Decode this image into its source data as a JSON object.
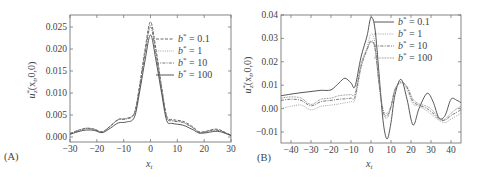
{
  "chart_data": [
    {
      "panel": "(A)",
      "type": "line",
      "xlabel": "x_t",
      "ylabel": "u*_z (x_t,0,0)",
      "xlim": [
        -30,
        30
      ],
      "ylim": [
        -0.001,
        0.028
      ],
      "xticks": [
        -30,
        -20,
        -10,
        0,
        10,
        20,
        30
      ],
      "xtick_labels": [
        "−30",
        "−20",
        "−10",
        "0",
        "10",
        "20",
        "30"
      ],
      "yticks": [
        0.0,
        0.005,
        0.01,
        0.015,
        0.02,
        0.025
      ],
      "ytick_labels": [
        "0.000",
        "0.005",
        "0.010",
        "0.015",
        "0.020",
        "0.025"
      ],
      "legend_position": "upper right",
      "grid": false,
      "x": [
        -30,
        -27,
        -24,
        -21,
        -18,
        -15,
        -12,
        -9,
        -6,
        -4,
        -2,
        0,
        2,
        4,
        6,
        8,
        10,
        12,
        14,
        16,
        18,
        20,
        22,
        24,
        26,
        28,
        30
      ],
      "series": [
        {
          "name": "b* = 0.1",
          "style": "dashed",
          "values": [
            0.0008,
            0.0015,
            0.002,
            0.0018,
            0.0012,
            0.0025,
            0.004,
            0.0042,
            0.0055,
            0.012,
            0.02,
            0.0262,
            0.02,
            0.012,
            0.0048,
            0.004,
            0.0038,
            0.0036,
            0.003,
            0.0022,
            0.0012,
            0.0012,
            0.0015,
            0.0018,
            0.0016,
            0.001,
            0.0004
          ]
        },
        {
          "name": "b* = 1",
          "style": "dotted",
          "values": [
            0.0008,
            0.0015,
            0.002,
            0.0018,
            0.0012,
            0.0025,
            0.004,
            0.0042,
            0.0055,
            0.0118,
            0.0195,
            0.0255,
            0.0195,
            0.0118,
            0.0046,
            0.0038,
            0.0036,
            0.0034,
            0.0028,
            0.002,
            0.0011,
            0.0011,
            0.0014,
            0.0016,
            0.0014,
            0.0009,
            0.0004
          ]
        },
        {
          "name": "b* = 10",
          "style": "dash-dot",
          "values": [
            0.0007,
            0.0014,
            0.0019,
            0.0017,
            0.0011,
            0.0024,
            0.0039,
            0.0041,
            0.0053,
            0.0115,
            0.019,
            0.025,
            0.019,
            0.0115,
            0.0045,
            0.0037,
            0.0035,
            0.0033,
            0.0027,
            0.002,
            0.0011,
            0.0011,
            0.0014,
            0.0016,
            0.0014,
            0.0009,
            0.0004
          ]
        },
        {
          "name": "b* = 100",
          "style": "solid",
          "values": [
            0.0006,
            0.0012,
            0.0016,
            0.0015,
            0.001,
            0.002,
            0.0032,
            0.0034,
            0.0045,
            0.0105,
            0.0175,
            0.0232,
            0.0175,
            0.0105,
            0.0038,
            0.0031,
            0.0029,
            0.0027,
            0.0022,
            0.0016,
            0.0009,
            0.0009,
            0.0011,
            0.0013,
            0.0012,
            0.0008,
            0.0003
          ]
        }
      ]
    },
    {
      "panel": "(B)",
      "type": "line",
      "xlabel": "x_t",
      "ylabel": "u*_z (x_t,0,0)",
      "xlim": [
        -45,
        45
      ],
      "ylim": [
        -0.015,
        0.04
      ],
      "xticks": [
        -40,
        -30,
        -20,
        -10,
        0,
        10,
        20,
        30,
        40
      ],
      "xtick_labels": [
        "−40",
        "−30",
        "−20",
        "−10",
        "0",
        "10",
        "20",
        "30",
        "40"
      ],
      "yticks": [
        -0.01,
        0.0,
        0.01,
        0.02,
        0.03,
        0.04
      ],
      "ytick_labels": [
        "−0.01",
        "0.00",
        "0.01",
        "0.02",
        "0.03",
        "0.04"
      ],
      "legend_position": "upper right",
      "grid": false,
      "x": [
        -45,
        -40,
        -35,
        -30,
        -25,
        -20,
        -16,
        -13,
        -10,
        -8,
        -5,
        -2,
        0,
        2,
        4,
        6,
        8,
        10,
        12,
        15,
        18,
        21,
        24,
        28,
        31,
        34,
        37,
        40,
        43,
        45
      ],
      "series": [
        {
          "name": "b* = 0.1",
          "style": "solid",
          "values": [
            0.0055,
            0.0062,
            0.0068,
            0.0073,
            0.0078,
            0.008,
            0.011,
            0.013,
            0.011,
            0.0095,
            0.022,
            0.031,
            0.039,
            0.034,
            0.015,
            -0.005,
            -0.013,
            -0.006,
            0.006,
            0.0125,
            0.004,
            -0.007,
            0.0,
            0.0065,
            0.003,
            -0.004,
            -0.003,
            0.004,
            0.0035,
            0.0025
          ]
        },
        {
          "name": "b* = 1",
          "style": "dotted",
          "values": [
            0.0,
            0.001,
            0.0015,
            -0.0005,
            0.001,
            0.0015,
            0.002,
            0.0025,
            0.003,
            0.004,
            0.017,
            0.026,
            0.032,
            0.028,
            0.012,
            0.0,
            -0.002,
            0.001,
            0.007,
            0.012,
            0.008,
            0.002,
            0.001,
            -0.001,
            -0.003,
            -0.005,
            -0.006,
            -0.0045,
            -0.003,
            -0.002
          ]
        },
        {
          "name": "b* = 10",
          "style": "dash-dot",
          "values": [
            0.0035,
            0.004,
            0.0035,
            0.0012,
            0.003,
            0.0035,
            0.004,
            0.0042,
            0.0045,
            0.005,
            0.018,
            0.025,
            0.029,
            0.026,
            0.011,
            -0.001,
            -0.003,
            0.001,
            0.008,
            0.0115,
            0.009,
            0.003,
            0.0015,
            0.0,
            -0.002,
            -0.0045,
            -0.005,
            -0.003,
            -0.0015,
            -0.0005
          ]
        },
        {
          "name": "b* = 100",
          "style": "dense-dotted",
          "values": [
            0.0045,
            0.005,
            0.0045,
            0.0018,
            0.004,
            0.0045,
            0.0055,
            0.0058,
            0.006,
            0.0065,
            0.019,
            0.0255,
            0.0285,
            0.0255,
            0.0105,
            -0.0015,
            -0.004,
            0.0005,
            0.0085,
            0.011,
            0.0095,
            0.004,
            0.002,
            0.001,
            -0.001,
            -0.004,
            -0.0045,
            -0.002,
            0.0,
            0.001
          ]
        }
      ]
    }
  ],
  "panels": {
    "a": {
      "label": "(A)",
      "xlabel": "x",
      "xlabel_sub": "t",
      "ylabel_main": "u",
      "ylabel_sup": "*",
      "ylabel_sub": "z",
      "ylabel_args": "(x",
      "ylabel_args_sub": "t",
      "ylabel_tail": ",0,0)"
    },
    "b": {
      "label": "(B)",
      "xlabel": "x",
      "xlabel_sub": "t",
      "ylabel_main": "u",
      "ylabel_sup": "*",
      "ylabel_sub": "z",
      "ylabel_args": "(x",
      "ylabel_args_sub": "t",
      "ylabel_tail": ",0,0)"
    }
  },
  "legend": {
    "a": [
      {
        "b": "b",
        "sup": "*",
        "val": " = 0.1"
      },
      {
        "b": "b",
        "sup": "*",
        "val": " = 1"
      },
      {
        "b": "b",
        "sup": "*",
        "val": " = 10"
      },
      {
        "b": "b",
        "sup": "*",
        "val": " = 100"
      }
    ],
    "b": [
      {
        "b": "b",
        "sup": "*",
        "val": " = 0.1"
      },
      {
        "b": "b",
        "sup": "*",
        "val": " = 1"
      },
      {
        "b": "b",
        "sup": "*",
        "val": " = 10"
      },
      {
        "b": "b",
        "sup": "*",
        "val": " = 100"
      }
    ]
  },
  "colors": {
    "axis": "#555555",
    "line": "#444444",
    "text": "#444444"
  }
}
